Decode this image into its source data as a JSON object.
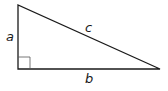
{
  "diagram": {
    "type": "right-triangle",
    "labels": {
      "a": "a",
      "b": "b",
      "c": "c"
    },
    "colors": {
      "stroke": "#1a1a1a",
      "right_angle_marker": "#555555",
      "background": "#ffffff"
    }
  }
}
